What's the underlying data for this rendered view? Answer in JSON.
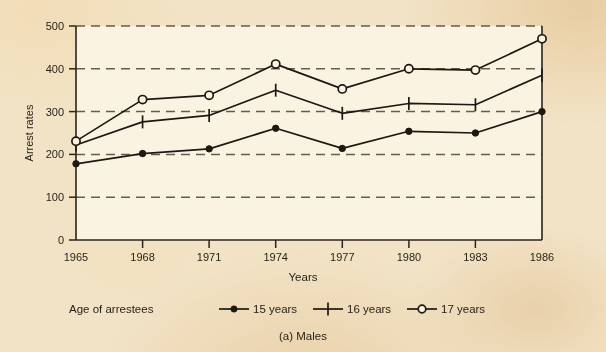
{
  "chart_data": {
    "type": "line",
    "title": "",
    "caption": "(a) Males",
    "xlabel": "Years",
    "ylabel": "Arrest rates",
    "categories": [
      "1965",
      "1968",
      "1971",
      "1974",
      "1977",
      "1980",
      "1983",
      "1986"
    ],
    "x": [
      1965,
      1968,
      1971,
      1974,
      1977,
      1980,
      1983,
      1986
    ],
    "xlim": [
      1965,
      1986
    ],
    "ylim": [
      0,
      500
    ],
    "yticks": [
      0,
      100,
      200,
      300,
      400,
      500
    ],
    "xticks": [
      1965,
      1968,
      1971,
      1974,
      1977,
      1980,
      1983,
      1986
    ],
    "grid": "horizontal-dashed",
    "legend_position": "below-plot",
    "legend_title": "Age of arrestees",
    "series": [
      {
        "name": "15 years",
        "marker": "filled-circle",
        "values": [
          178,
          202,
          213,
          261,
          214,
          254,
          250,
          300
        ]
      },
      {
        "name": "16 years",
        "marker": "plus",
        "values": [
          222,
          276,
          291,
          350,
          296,
          319,
          316,
          385
        ]
      },
      {
        "name": "17 years",
        "marker": "open-circle",
        "values": [
          231,
          328,
          338,
          411,
          353,
          400,
          397,
          470
        ]
      }
    ]
  },
  "axes": {
    "y_tick_labels": [
      "500",
      "400",
      "300",
      "200",
      "100",
      "0"
    ],
    "x_tick_labels": [
      "1965",
      "1968",
      "1971",
      "1974",
      "1977",
      "1980",
      "1983",
      "1986"
    ],
    "y_axis_title": "Arrest rates",
    "x_axis_title": "Years"
  },
  "legend": {
    "title": "Age of arrestees",
    "entries": [
      {
        "label": "15 years",
        "marker": "filled-circle"
      },
      {
        "label": "16 years",
        "marker": "plus"
      },
      {
        "label": "17 years",
        "marker": "open-circle"
      }
    ]
  },
  "caption": {
    "text": "(a) Males"
  },
  "colors": {
    "paper": "#f2e3c6",
    "plot_background": "#faf3e2",
    "ink": "#1d1812",
    "grid": "#5d5344"
  }
}
